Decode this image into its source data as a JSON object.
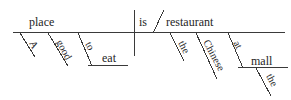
{
  "diagram": {
    "kind": "reed-kellogg-sentence-diagram",
    "sentence": "A good place to eat is the Chinese restaurant at the mall.",
    "colors": {
      "background": "#ffffff",
      "line": "#3a3a3a",
      "text": "#262626"
    },
    "words": {
      "subject": "place",
      "subject_article": "A",
      "subject_adjective": "good",
      "infinitive_marker": "to",
      "infinitive_verb": "eat",
      "verb": "is",
      "predicate_nominative": "restaurant",
      "pn_article": "the",
      "pn_adjective": "Chinese",
      "preposition": "at",
      "object_article": "the",
      "object_of_preposition": "mall"
    },
    "labels": [
      {
        "id": "subject",
        "text": "place",
        "x": 29,
        "y": 26,
        "rotation": 0
      },
      {
        "id": "verb",
        "text": "is",
        "x": 139,
        "y": 26,
        "rotation": 0
      },
      {
        "id": "predicate-nominative",
        "text": "restaurant",
        "x": 166,
        "y": 26,
        "rotation": 0
      },
      {
        "id": "infinitive-verb",
        "text": "eat",
        "x": 102,
        "y": 62,
        "rotation": 0
      },
      {
        "id": "object-of-preposition",
        "text": "mall",
        "x": 251,
        "y": 65,
        "rotation": 0
      },
      {
        "id": "subject-article",
        "text": "A",
        "x": 29,
        "y": 43,
        "rotation": 62
      },
      {
        "id": "subject-adjective",
        "text": "good",
        "x": 56,
        "y": 42,
        "rotation": 62
      },
      {
        "id": "infinitive-marker",
        "text": "to",
        "x": 85,
        "y": 44,
        "rotation": 62
      },
      {
        "id": "pn-article",
        "text": "the",
        "x": 178,
        "y": 43,
        "rotation": 62
      },
      {
        "id": "pn-adjective",
        "text": "Chinese",
        "x": 203,
        "y": 42,
        "rotation": 62
      },
      {
        "id": "preposition",
        "text": "at",
        "x": 233,
        "y": 43,
        "rotation": 62
      },
      {
        "id": "object-article",
        "text": "the",
        "x": 266,
        "y": 76,
        "rotation": 62
      }
    ]
  }
}
